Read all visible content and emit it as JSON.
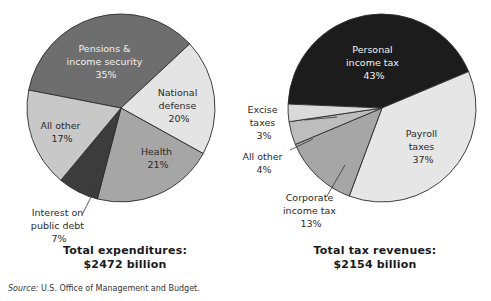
{
  "chart_data": [
    {
      "type": "pie",
      "title": "Total expenditures: $2472 billion",
      "total_label": "Total expenditures:",
      "total_value": "$2472 billion",
      "slices": [
        {
          "label": "Pensions & income security",
          "value": 35,
          "color": "#6e6e6e"
        },
        {
          "label": "National defense",
          "value": 20,
          "color": "#e4e4e4"
        },
        {
          "label": "Health",
          "value": 21,
          "color": "#a6a6a6"
        },
        {
          "label": "Interest on public debt",
          "value": 7,
          "color": "#3c3c3c"
        },
        {
          "label": "All other",
          "value": 17,
          "color": "#c8c8c8"
        }
      ],
      "units": "%"
    },
    {
      "type": "pie",
      "title": "Total tax revenues: $2154 billion",
      "total_label": "Total tax revenues:",
      "total_value": "$2154 billion",
      "slices": [
        {
          "label": "Personal income tax",
          "value": 43,
          "color": "#1c1c1c"
        },
        {
          "label": "Payroll taxes",
          "value": 37,
          "color": "#e6e6e6"
        },
        {
          "label": "Corporate income tax",
          "value": 13,
          "color": "#a6a6a6"
        },
        {
          "label": "All other",
          "value": 4,
          "color": "#bdbdbd"
        },
        {
          "label": "Excise taxes",
          "value": 3,
          "color": "#dadada"
        }
      ],
      "units": "%"
    }
  ],
  "labels": {
    "left": {
      "pensions": [
        "Pensions &",
        "income security",
        "35%"
      ],
      "defense": [
        "National",
        "defense",
        "20%"
      ],
      "health": [
        "Health",
        "21%"
      ],
      "interest": [
        "Interest on",
        "public debt",
        "7%"
      ],
      "other": [
        "All other",
        "17%"
      ]
    },
    "right": {
      "personal": [
        "Personal",
        "income tax",
        "43%"
      ],
      "payroll": [
        "Payroll",
        "taxes",
        "37%"
      ],
      "corporate": [
        "Corporate",
        "income tax",
        "13%"
      ],
      "other": [
        "All other",
        "4%"
      ],
      "excise": [
        "Excise",
        "taxes",
        "3%"
      ]
    }
  },
  "totals": {
    "left_line1": "Total expenditures:",
    "left_line2": "$2472 billion",
    "right_line1": "Total tax revenues:",
    "right_line2": "$2154 billion"
  },
  "source": {
    "prefix": "Source:",
    "text": " U.S. Office of Management and Budget."
  }
}
